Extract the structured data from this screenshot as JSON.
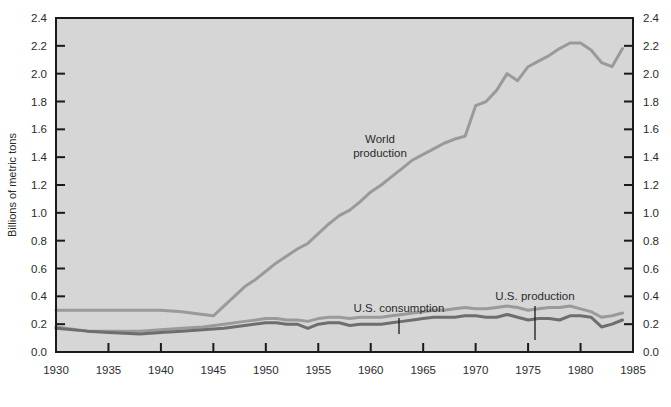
{
  "chart_data": {
    "type": "line",
    "title": "",
    "subtitle": "",
    "xlabel": "",
    "ylabel": "Billions of metric tons",
    "xlim": [
      1930,
      1985
    ],
    "ylim": [
      0.0,
      2.4
    ],
    "grid": false,
    "legend_position": "inline-annotations",
    "background_color": "#d6d6d6",
    "xticks": [
      1930,
      1935,
      1940,
      1945,
      1950,
      1955,
      1960,
      1965,
      1970,
      1975,
      1980,
      1985
    ],
    "xtick_labels": [
      "1930",
      "1935",
      "1940",
      "1945",
      "1950",
      "1955",
      "1960",
      "1965",
      "1970",
      "1975",
      "1980",
      "1985"
    ],
    "yticks": [
      0.0,
      0.2,
      0.4,
      0.6,
      0.8,
      1.0,
      1.2,
      1.4,
      1.6,
      1.8,
      2.0,
      2.2,
      2.4
    ],
    "ytick_labels": [
      "0.0",
      "0.2",
      "0.4",
      "0.6",
      "0.8",
      "1.0",
      "1.2",
      "1.4",
      "1.6",
      "1.8",
      "2.0",
      "2.2",
      "2.4"
    ],
    "left_axis_labels_visible": true,
    "right_axis_labels_visible": true,
    "series": [
      {
        "name": "World production",
        "color": "#9a9a9a",
        "line_width": 3.0,
        "annotation": "World\nproduction",
        "x": [
          1930,
          1932,
          1935,
          1938,
          1940,
          1942,
          1944,
          1945,
          1946,
          1947,
          1948,
          1949,
          1950,
          1951,
          1952,
          1953,
          1954,
          1955,
          1956,
          1957,
          1958,
          1959,
          1960,
          1961,
          1962,
          1963,
          1964,
          1965,
          1966,
          1967,
          1968,
          1969,
          1970,
          1971,
          1972,
          1973,
          1974,
          1975,
          1976,
          1977,
          1978,
          1979,
          1980,
          1981,
          1982,
          1983,
          1984
        ],
        "values": [
          0.3,
          0.3,
          0.3,
          0.3,
          0.3,
          0.29,
          0.27,
          0.26,
          0.33,
          0.4,
          0.47,
          0.52,
          0.58,
          0.64,
          0.69,
          0.74,
          0.78,
          0.85,
          0.92,
          0.98,
          1.02,
          1.08,
          1.15,
          1.2,
          1.26,
          1.32,
          1.38,
          1.42,
          1.46,
          1.5,
          1.53,
          1.55,
          1.77,
          1.8,
          1.88,
          2.0,
          1.95,
          2.05,
          2.09,
          2.13,
          2.18,
          2.22,
          2.22,
          2.17,
          2.08,
          2.05,
          2.18
        ]
      },
      {
        "name": "U.S. consumption",
        "color": "#9a9a9a",
        "line_width": 3.0,
        "annotation": "U.S. consumption",
        "x": [
          1930,
          1933,
          1935,
          1938,
          1940,
          1942,
          1944,
          1946,
          1948,
          1950,
          1951,
          1952,
          1953,
          1954,
          1955,
          1956,
          1957,
          1958,
          1959,
          1960,
          1961,
          1962,
          1963,
          1964,
          1965,
          1966,
          1967,
          1968,
          1969,
          1970,
          1971,
          1972,
          1973,
          1974,
          1975,
          1976,
          1977,
          1978,
          1979,
          1980,
          1981,
          1982,
          1983,
          1984
        ],
        "values": [
          0.18,
          0.15,
          0.15,
          0.15,
          0.16,
          0.17,
          0.18,
          0.2,
          0.22,
          0.24,
          0.24,
          0.23,
          0.23,
          0.22,
          0.24,
          0.25,
          0.25,
          0.24,
          0.25,
          0.25,
          0.25,
          0.26,
          0.27,
          0.28,
          0.29,
          0.3,
          0.3,
          0.31,
          0.32,
          0.31,
          0.31,
          0.32,
          0.33,
          0.32,
          0.3,
          0.31,
          0.32,
          0.32,
          0.33,
          0.31,
          0.29,
          0.25,
          0.26,
          0.28
        ]
      },
      {
        "name": "U.S. production",
        "color": "#6e6e6e",
        "line_width": 3.0,
        "annotation": "U.S. production",
        "x": [
          1930,
          1933,
          1935,
          1938,
          1940,
          1942,
          1944,
          1946,
          1948,
          1950,
          1951,
          1952,
          1953,
          1954,
          1955,
          1956,
          1957,
          1958,
          1959,
          1960,
          1961,
          1962,
          1963,
          1964,
          1965,
          1966,
          1967,
          1968,
          1969,
          1970,
          1971,
          1972,
          1973,
          1974,
          1975,
          1976,
          1977,
          1978,
          1979,
          1980,
          1981,
          1982,
          1983,
          1984
        ],
        "values": [
          0.17,
          0.15,
          0.14,
          0.13,
          0.14,
          0.15,
          0.16,
          0.17,
          0.19,
          0.21,
          0.21,
          0.2,
          0.2,
          0.17,
          0.2,
          0.21,
          0.21,
          0.19,
          0.2,
          0.2,
          0.2,
          0.21,
          0.22,
          0.23,
          0.24,
          0.25,
          0.25,
          0.25,
          0.26,
          0.26,
          0.25,
          0.25,
          0.27,
          0.25,
          0.23,
          0.24,
          0.24,
          0.23,
          0.26,
          0.26,
          0.25,
          0.18,
          0.2,
          0.23
        ]
      }
    ],
    "annotations": [
      {
        "id": "world-production",
        "lines": [
          "World",
          "production"
        ],
        "text_x": 380,
        "text_y": 143,
        "anchor": "middle",
        "leader": null
      },
      {
        "id": "us-consumption",
        "lines": [
          "U.S. consumption"
        ],
        "text_x": 399,
        "text_y": 312,
        "anchor": "middle",
        "leader": {
          "x1": 399,
          "y1": 318,
          "x2": 399,
          "y2": 334
        }
      },
      {
        "id": "us-production",
        "lines": [
          "U.S. production"
        ],
        "text_x": 535,
        "text_y": 300,
        "anchor": "middle",
        "leader": {
          "x1": 535,
          "y1": 306,
          "x2": 535,
          "y2": 340
        }
      }
    ]
  },
  "figure": {
    "plot_left": 56,
    "plot_right": 633,
    "plot_top": 18,
    "plot_bottom": 352,
    "axis_color": "#1a1a1a",
    "page_background": "#ffffff"
  }
}
